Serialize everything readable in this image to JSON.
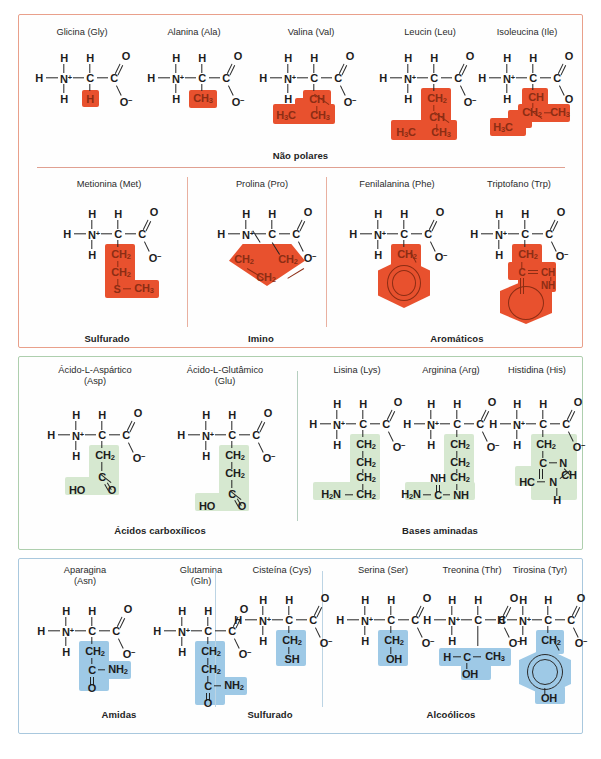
{
  "figure": {
    "caption_fragment": ""
  },
  "palette": {
    "nonpolar_highlight": "#e8512e",
    "acid_highlight": "#d6e8d0",
    "amide_highlight": "#9ec9e6",
    "nonpolar_border": "#e9a08b",
    "acid_border": "#aecfae",
    "amide_border": "#a9c8de",
    "atom_color": "#1c1c1c"
  },
  "panels": [
    {
      "id": "nonpolar-panel",
      "groups": [
        {
          "id": "nao-polares",
          "label": "Não polares",
          "members": [
            "Glicina (Gly)",
            "Alanina (Ala)",
            "Valina (Val)",
            "Leucin (Leu)",
            "Isoleucina (Ile)"
          ]
        },
        {
          "id": "sulfurado-1",
          "label": "Sulfurado",
          "members": [
            "Metionina (Met)"
          ]
        },
        {
          "id": "imino",
          "label": "Imino",
          "members": [
            "Prolina (Pro)"
          ]
        },
        {
          "id": "aromaticos",
          "label": "Aromáticos",
          "members": [
            "Fenilalanina (Phe)",
            "Triptofano (Trp)"
          ]
        }
      ]
    },
    {
      "id": "acid-panel",
      "groups": [
        {
          "id": "acidos-carboxilicos",
          "label": "Ácidos carboxílicos",
          "members": [
            "Ácido-L-Aspártico\n(Asp)",
            "Ácido-L-Glutâmico\n(Glu)"
          ]
        },
        {
          "id": "bases-aminadas",
          "label": "Bases aminadas",
          "members": [
            "Lisina (Lys)",
            "Arginina (Arg)",
            "Histidina (His)"
          ]
        }
      ]
    },
    {
      "id": "amide-panel",
      "groups": [
        {
          "id": "amidas",
          "label": "Amidas",
          "members": [
            "Aparagina\n(Asn)",
            "Glutamina\n(Gln)"
          ]
        },
        {
          "id": "sulfurado-2",
          "label": "Sulfurado",
          "members": [
            "Cisteína (Cys)"
          ]
        },
        {
          "id": "alcoolicos",
          "label": "Alcoólicos",
          "members": [
            "Serina (Ser)",
            "Treonina (Thr)",
            "Tirosina (Tyr)"
          ]
        }
      ]
    }
  ],
  "molecules": {
    "gly": {
      "name": "Glicina (Gly)",
      "side_chain": [
        "H"
      ]
    },
    "ala": {
      "name": "Alanina (Ala)",
      "side_chain": [
        "CH3"
      ]
    },
    "val": {
      "name": "Valina (Val)",
      "side_chain": [
        "CH",
        "H3C",
        "CH3"
      ]
    },
    "leu": {
      "name": "Leucin (Leu)",
      "side_chain": [
        "CH2",
        "CH",
        "H3C",
        "CH3"
      ]
    },
    "ile": {
      "name": "Isoleucina (Ile)",
      "side_chain": [
        "CH",
        "CH2",
        "CH3",
        "H3C"
      ]
    },
    "met": {
      "name": "Metionina (Met)",
      "side_chain": [
        "CH2",
        "CH2",
        "S",
        "CH3"
      ]
    },
    "pro": {
      "name": "Prolina (Pro)",
      "side_chain": [
        "CH2",
        "CH2",
        "CH2"
      ]
    },
    "phe": {
      "name": "Fenilalanina (Phe)",
      "side_chain": [
        "CH2",
        "benzene-ring"
      ]
    },
    "trp": {
      "name": "Triptofano (Trp)",
      "side_chain": [
        "CH2",
        "C",
        "CH",
        "NH",
        "indole-ring"
      ]
    },
    "asp": {
      "name": "Ácido-L-Aspártico\n(Asp)",
      "side_chain": [
        "CH2",
        "C",
        "HO",
        "O"
      ]
    },
    "glu": {
      "name": "Ácido-L-Glutâmico\n(Glu)",
      "side_chain": [
        "CH2",
        "CH2",
        "C",
        "HO",
        "O"
      ]
    },
    "lys": {
      "name": "Lisina (Lys)",
      "side_chain": [
        "CH2",
        "CH2",
        "CH2",
        "CH2",
        "H2N"
      ]
    },
    "arg": {
      "name": "Arginina (Arg)",
      "side_chain": [
        "CH2",
        "CH2",
        "CH2",
        "NH",
        "C",
        "NH",
        "H2N"
      ]
    },
    "his": {
      "name": "Histidina (His)",
      "side_chain": [
        "CH2",
        "C",
        "N",
        "CH",
        "N",
        "HC",
        "H"
      ]
    },
    "asn": {
      "name": "Aparagina\n(Asn)",
      "side_chain": [
        "CH2",
        "C",
        "NH2",
        "O"
      ]
    },
    "gln": {
      "name": "Glutamina\n(Gln)",
      "side_chain": [
        "CH2",
        "CH2",
        "C",
        "NH2",
        "O"
      ]
    },
    "cys": {
      "name": "Cisteína (Cys)",
      "side_chain": [
        "CH2",
        "SH"
      ]
    },
    "ser": {
      "name": "Serina (Ser)",
      "side_chain": [
        "CH2",
        "OH"
      ]
    },
    "thr": {
      "name": "Treonina (Thr)",
      "side_chain": [
        "H",
        "C",
        "CH3",
        "OH"
      ]
    },
    "tyr": {
      "name": "Tirosina (Tyr)",
      "side_chain": [
        "CH2",
        "benzene-ring",
        "OH"
      ]
    }
  },
  "backbone": {
    "h_left": "H",
    "n": "N",
    "n_charge": "+",
    "h_top_n": "H",
    "h_bottom_n": "H",
    "c_alpha": "C",
    "h_alpha": "H",
    "c_carboxyl": "C",
    "o_double": "O",
    "o_minus": "O",
    "o_minus_charge": "−"
  }
}
